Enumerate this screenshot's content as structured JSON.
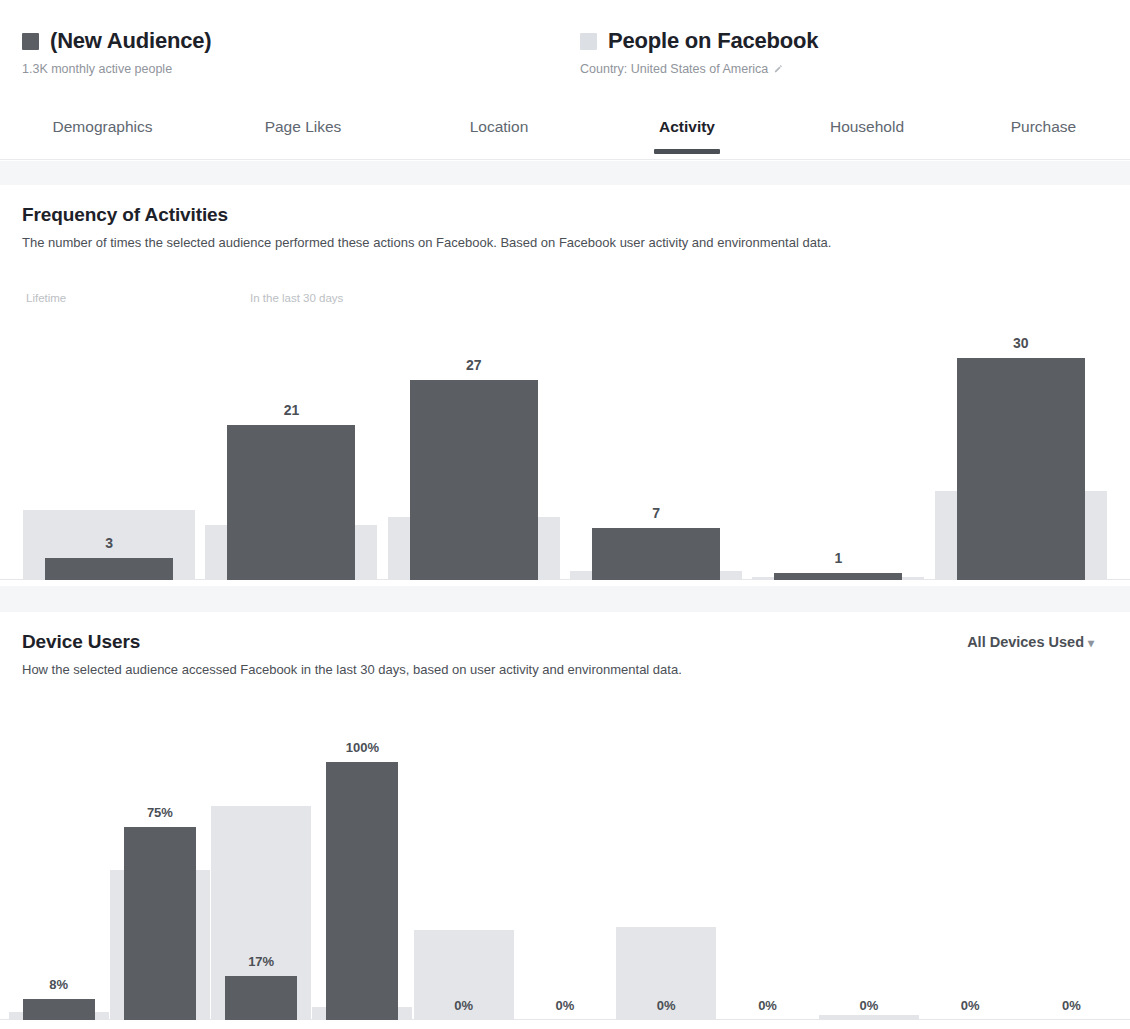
{
  "header": {
    "audience": {
      "swatch_color": "#5b5e63",
      "title": "(New Audience)",
      "subtitle": "1.3K monthly active people",
      "swatch_icon": "legend-swatch-dark"
    },
    "facebook": {
      "swatch_color": "#dcdfe3",
      "title": "People on Facebook",
      "subtitle": "Country: United States of America",
      "edit_icon": "pencil-icon",
      "swatch_icon": "legend-swatch-light"
    }
  },
  "tabs": [
    {
      "label": "Demographics",
      "active": false
    },
    {
      "label": "Page Likes",
      "active": false
    },
    {
      "label": "Location",
      "active": false
    },
    {
      "label": "Activity",
      "active": true
    },
    {
      "label": "Household",
      "active": false
    },
    {
      "label": "Purchase",
      "active": false
    }
  ],
  "sections": {
    "frequency": {
      "title": "Frequency of Activities",
      "description": "The number of times the selected audience performed these actions on Facebook. Based on Facebook user activity and environmental data.",
      "legend_left": "Lifetime",
      "legend_right": "In the last 30 days"
    },
    "devices": {
      "title": "Device Users",
      "description": "How the selected audience accessed Facebook in the last 30 days, based on user activity and environmental data.",
      "dropdown_label": "All Devices Used",
      "dropdown_caret": "chevron-down-icon"
    }
  },
  "colors": {
    "audience_bar": "#5b5e63",
    "benchmark_bar": "#e3e5e8",
    "band": "#f5f6f7",
    "heading": "#1d2129",
    "muted": "#90949c"
  },
  "chart_data": [
    {
      "type": "bar",
      "title": "Frequency of Activities",
      "xlabel": "",
      "ylabel": "",
      "grid": false,
      "legend": [
        "Lifetime",
        "In the last 30 days"
      ],
      "legend_position": "top-left",
      "categories": [
        "Pages Liked",
        "Comments",
        "Posts Liked",
        "Posts Shared",
        "Promotions Redeemed",
        "Ads Clicked"
      ],
      "series": [
        {
          "name": "(New Audience)",
          "values": [
            3,
            21,
            27,
            7,
            1,
            30
          ],
          "labels": [
            "3",
            "21",
            "27",
            "7",
            "1",
            "30"
          ],
          "color": "#5b5e63"
        },
        {
          "name": "People on Facebook",
          "values": [
            9.5,
            7.5,
            8.5,
            1.2,
            0.4,
            12.0
          ],
          "color": "#e3e5e8"
        }
      ],
      "ylim": [
        0,
        33
      ]
    },
    {
      "type": "bar",
      "title": "Device Users",
      "xlabel": "",
      "ylabel": "",
      "grid": false,
      "unit": "%",
      "categories": [
        "Desktop Only",
        "Desktop &\nMobile",
        "Mobile Only",
        "Computer",
        "iPhone/iPod",
        "iPad",
        "Android",
        "Blackberry",
        "Mobile Web",
        "Feature\nPhone",
        "Unknown"
      ],
      "series": [
        {
          "name": "(New Audience)",
          "values": [
            8,
            75,
            17,
            100,
            0,
            0,
            0,
            0,
            0,
            0,
            0
          ],
          "labels": [
            "8%",
            "75%",
            "17%",
            "100%",
            "0%",
            "0%",
            "0%",
            "0%",
            "0%",
            "0%",
            "0%"
          ],
          "color": "#5b5e63"
        },
        {
          "name": "People on Facebook",
          "values": [
            3,
            58,
            83,
            5,
            35,
            0,
            36,
            0,
            2,
            0,
            0
          ],
          "color": "#e3e5e8"
        }
      ],
      "ylim": [
        0,
        100
      ]
    }
  ]
}
